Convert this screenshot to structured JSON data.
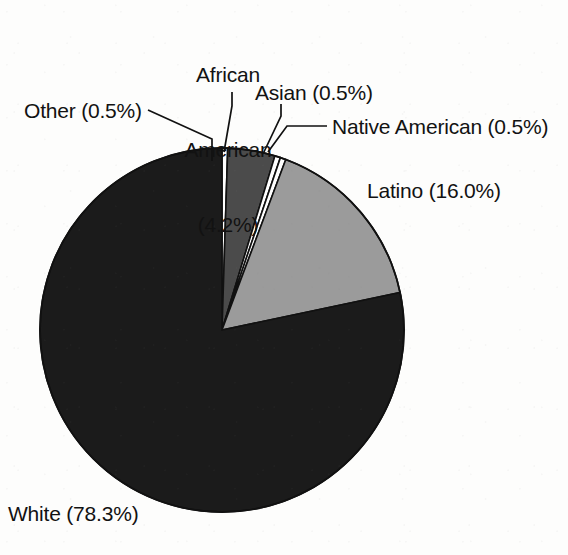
{
  "chart_data": {
    "type": "pie",
    "title": "",
    "subtitle": "",
    "xlabel": "",
    "ylabel": "",
    "legend_position": "none",
    "grid": false,
    "label_format": "{name} ({value}%)",
    "start_angle_deg": -90,
    "direction": "clockwise",
    "categories": [
      "Other",
      "African American",
      "Asian",
      "Native American",
      "Latino",
      "White"
    ],
    "values": [
      0.5,
      4.2,
      0.5,
      0.5,
      16.0,
      78.3
    ],
    "slices": [
      {
        "name": "Other",
        "value": 0.5,
        "value_text": "0.5%",
        "label": "Other (0.5%)",
        "color": "#ffffff",
        "stroke": "#111111"
      },
      {
        "name": "African American",
        "value": 4.2,
        "value_text": "4.2%",
        "label": "African American (4.2%)",
        "label_lines": [
          "African",
          "American",
          "(4.2%)"
        ],
        "color": "#4b4b4b",
        "stroke": "#111111"
      },
      {
        "name": "Asian",
        "value": 0.5,
        "value_text": "0.5%",
        "label": "Asian (0.5%)",
        "color": "#ffffff",
        "stroke": "#111111"
      },
      {
        "name": "Native American",
        "value": 0.5,
        "value_text": "0.5%",
        "label": "Native American (0.5%)",
        "color": "#ffffff",
        "stroke": "#111111"
      },
      {
        "name": "Latino",
        "value": 16.0,
        "value_text": "16.0%",
        "label": "Latino (16.0%)",
        "color": "#9b9b9b",
        "stroke": "#111111"
      },
      {
        "name": "White",
        "value": 78.3,
        "value_text": "78.3%",
        "label": "White (78.3%)",
        "color": "#1b1b1b",
        "stroke": "#111111"
      }
    ],
    "total": 100.0,
    "units": "percent"
  },
  "labels": {
    "african_american_line1": "African",
    "african_american_line2": "American",
    "african_american_line3": "(4.2%)",
    "asian": "Asian (0.5%)",
    "other": "Other (0.5%)",
    "native_american": "Native American (0.5%)",
    "latino": "Latino (16.0%)",
    "white": "White (78.3%)"
  },
  "colors": {
    "background": "#fdfdfc",
    "text": "#121212",
    "outline": "#111111",
    "slice_white": "#ffffff",
    "slice_light_gray": "#9b9b9b",
    "slice_dark_gray": "#4b4b4b",
    "slice_black": "#1b1b1b",
    "leader_line": "#111111"
  },
  "geometry": {
    "center_x": 222,
    "center_y": 330,
    "radius": 182
  }
}
